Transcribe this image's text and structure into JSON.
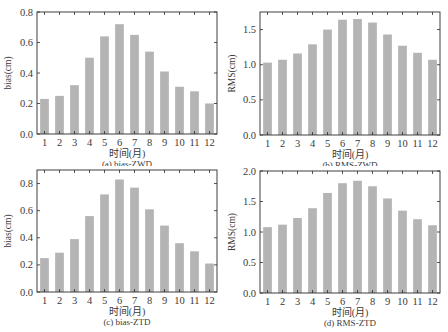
{
  "figure": {
    "background": "#ffffff",
    "bar_color": "#b4b4b4",
    "axis_color": "#2a2a2a"
  },
  "chart_data": [
    {
      "id": "a",
      "type": "bar",
      "caption": "(a) bias-ZWD",
      "xlabel": "时间(月)",
      "ylabel": "bias(cm)",
      "categories": [
        "1",
        "2",
        "3",
        "4",
        "5",
        "6",
        "7",
        "8",
        "9",
        "10",
        "11",
        "12"
      ],
      "values": [
        0.23,
        0.25,
        0.32,
        0.5,
        0.64,
        0.72,
        0.65,
        0.54,
        0.41,
        0.31,
        0.28,
        0.2
      ],
      "ylim": [
        0,
        0.8
      ],
      "yticks": [
        0.0,
        0.2,
        0.4,
        0.6,
        0.8
      ],
      "ytick_labels": [
        "0.0",
        "0.2",
        "0.4",
        "0.6",
        "0.8"
      ],
      "grid": false,
      "legend": null
    },
    {
      "id": "b",
      "type": "bar",
      "caption": "(b) RMS-ZWD",
      "xlabel": "时间(月)",
      "ylabel": "RMS(cm)",
      "categories": [
        "1",
        "2",
        "3",
        "4",
        "5",
        "6",
        "7",
        "8",
        "9",
        "10",
        "11",
        "12"
      ],
      "values": [
        1.03,
        1.07,
        1.16,
        1.29,
        1.5,
        1.64,
        1.65,
        1.6,
        1.43,
        1.27,
        1.17,
        1.07
      ],
      "ylim": [
        0,
        1.75
      ],
      "yticks": [
        0.0,
        0.5,
        1.0,
        1.5
      ],
      "ytick_labels": [
        "0.0",
        "0.5",
        "1.0",
        "1.5"
      ],
      "grid": false,
      "legend": null
    },
    {
      "id": "c",
      "type": "bar",
      "caption": "(c) bias-ZTD",
      "xlabel": "时间(月)",
      "ylabel": "bias(cm)",
      "categories": [
        "1",
        "2",
        "3",
        "4",
        "5",
        "6",
        "7",
        "8",
        "9",
        "10",
        "11",
        "12"
      ],
      "values": [
        0.25,
        0.29,
        0.39,
        0.56,
        0.72,
        0.83,
        0.77,
        0.61,
        0.49,
        0.36,
        0.3,
        0.21
      ],
      "ylim": [
        0,
        0.9
      ],
      "yticks": [
        0.0,
        0.2,
        0.4,
        0.6,
        0.8
      ],
      "ytick_labels": [
        "0.0",
        "0.2",
        "0.4",
        "0.6",
        "0.8"
      ],
      "grid": false,
      "legend": null
    },
    {
      "id": "d",
      "type": "bar",
      "caption": "(d) RMS-ZTD",
      "xlabel": "时间(月)",
      "ylabel": "RMS(cm)",
      "categories": [
        "1",
        "2",
        "3",
        "4",
        "5",
        "6",
        "7",
        "8",
        "9",
        "10",
        "11",
        "12"
      ],
      "values": [
        1.08,
        1.12,
        1.23,
        1.39,
        1.64,
        1.8,
        1.84,
        1.75,
        1.55,
        1.35,
        1.21,
        1.11
      ],
      "ylim": [
        0,
        2.0
      ],
      "yticks": [
        0.0,
        0.5,
        1.0,
        1.5,
        2.0
      ],
      "ytick_labels": [
        "0.0",
        "0.5",
        "1.0",
        "1.5",
        "2.0"
      ],
      "grid": false,
      "legend": null
    }
  ]
}
